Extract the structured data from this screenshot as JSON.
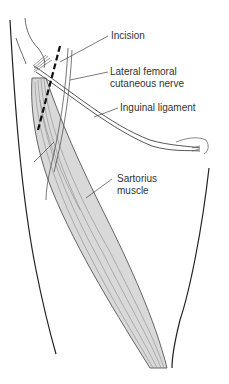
{
  "labels": {
    "incision": "Incision",
    "lateral_femoral_line1": "Lateral femoral",
    "lateral_femoral_line2": "cutaneous nerve",
    "inguinal": "Inguinal ligament",
    "sartorius_line1": "Sartorius",
    "sartorius_line2": "muscle"
  },
  "colors": {
    "outline": "#222222",
    "muscle_fill": "#d9d9d9",
    "muscle_stroke": "#555555",
    "fiber": "#8a8a8a",
    "leader": "#444444",
    "text": "#333333"
  }
}
